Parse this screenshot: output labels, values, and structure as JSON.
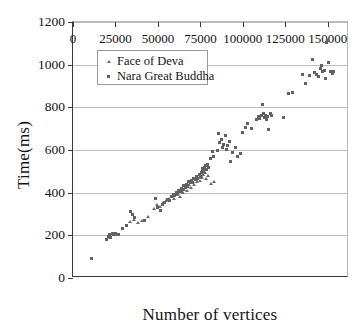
{
  "chart_data": {
    "type": "scatter",
    "title": "",
    "xlabel": "Number of vertices",
    "ylabel": "Time(ms)",
    "xlim": [
      0,
      162500
    ],
    "ylim": [
      0,
      1200
    ],
    "grid": true,
    "grid_axis": "y",
    "legend_position": "upper-left-inside",
    "xticks": [
      0,
      25000,
      50000,
      75000,
      100000,
      125000,
      150000
    ],
    "xtick_labels": [
      "0",
      "25000",
      "50000",
      "75000",
      "100000",
      "125000",
      "150000"
    ],
    "yticks": [
      0,
      200,
      400,
      600,
      800,
      1000,
      1200
    ],
    "ytick_labels": [
      "0",
      "200",
      "400",
      "600",
      "800",
      "1000",
      "1200"
    ],
    "marker_color": "#616161",
    "series": [
      {
        "name": "Face of Deva",
        "marker": "triangle",
        "color": "#6a6a6a",
        "points": [
          [
            21000,
            196
          ],
          [
            22000,
            188
          ],
          [
            23500,
            205
          ],
          [
            26000,
            200
          ],
          [
            33500,
            262
          ],
          [
            36000,
            272
          ],
          [
            38500,
            258
          ],
          [
            40500,
            268
          ],
          [
            44000,
            288
          ],
          [
            47500,
            322
          ],
          [
            49500,
            340
          ],
          [
            51000,
            332
          ],
          [
            53000,
            352
          ],
          [
            55000,
            360
          ],
          [
            56500,
            368
          ],
          [
            58000,
            378
          ],
          [
            59500,
            372
          ],
          [
            61000,
            388
          ],
          [
            62000,
            396
          ],
          [
            63000,
            382
          ],
          [
            64000,
            404
          ],
          [
            64800,
            398
          ],
          [
            65500,
            412
          ],
          [
            66200,
            420
          ],
          [
            67000,
            408
          ],
          [
            67800,
            428
          ],
          [
            68500,
            436
          ],
          [
            69200,
            424
          ],
          [
            70000,
            444
          ],
          [
            70800,
            452
          ],
          [
            71500,
            438
          ],
          [
            72200,
            460
          ],
          [
            73000,
            448
          ],
          [
            73800,
            468
          ],
          [
            74500,
            456
          ],
          [
            75200,
            476
          ],
          [
            76000,
            470
          ],
          [
            76800,
            484
          ],
          [
            77500,
            492
          ],
          [
            78500,
            462
          ],
          [
            79500,
            478
          ],
          [
            81000,
            440
          ],
          [
            83000,
            452
          ]
        ]
      },
      {
        "name": "Nara Great Buddha",
        "marker": "square",
        "color": "#616161",
        "points": [
          [
            11000,
            90
          ],
          [
            20000,
            182
          ],
          [
            20800,
            196
          ],
          [
            21500,
            206
          ],
          [
            22200,
            192
          ],
          [
            23000,
            210
          ],
          [
            24000,
            202
          ],
          [
            25000,
            208
          ],
          [
            26500,
            204
          ],
          [
            29000,
            232
          ],
          [
            31500,
            246
          ],
          [
            34000,
            312
          ],
          [
            35000,
            300
          ],
          [
            36500,
            282
          ],
          [
            42000,
            268
          ],
          [
            48500,
            374
          ],
          [
            50000,
            330
          ],
          [
            51500,
            318
          ],
          [
            52500,
            346
          ],
          [
            54000,
            356
          ],
          [
            55500,
            368
          ],
          [
            57000,
            362
          ],
          [
            58000,
            380
          ],
          [
            59000,
            392
          ],
          [
            60000,
            386
          ],
          [
            60800,
            400
          ],
          [
            61500,
            394
          ],
          [
            62200,
            412
          ],
          [
            63000,
            406
          ],
          [
            63800,
            420
          ],
          [
            64500,
            414
          ],
          [
            65200,
            432
          ],
          [
            66000,
            426
          ],
          [
            66800,
            440
          ],
          [
            67500,
            434
          ],
          [
            68200,
            452
          ],
          [
            69000,
            446
          ],
          [
            69800,
            458
          ],
          [
            70500,
            450
          ],
          [
            71200,
            466
          ],
          [
            72000,
            460
          ],
          [
            72800,
            474
          ],
          [
            73500,
            468
          ],
          [
            74200,
            486
          ],
          [
            75000,
            478
          ],
          [
            75500,
            496
          ],
          [
            76000,
            506
          ],
          [
            76400,
            514
          ],
          [
            76800,
            500
          ],
          [
            77200,
            520
          ],
          [
            77600,
            512
          ],
          [
            78000,
            526
          ],
          [
            78500,
            508
          ],
          [
            79000,
            534
          ],
          [
            80000,
            516
          ],
          [
            81000,
            560
          ],
          [
            82000,
            594
          ],
          [
            83000,
            570
          ],
          [
            85000,
            600
          ],
          [
            85800,
            676
          ],
          [
            86500,
            634
          ],
          [
            87200,
            648
          ],
          [
            88000,
            612
          ],
          [
            88800,
            628
          ],
          [
            89500,
            668
          ],
          [
            90200,
            602
          ],
          [
            91000,
            620
          ],
          [
            92000,
            640
          ],
          [
            93000,
            546
          ],
          [
            94000,
            586
          ],
          [
            95500,
            610
          ],
          [
            97000,
            568
          ],
          [
            98500,
            584
          ],
          [
            100000,
            684
          ],
          [
            101500,
            706
          ],
          [
            103000,
            722
          ],
          [
            105000,
            700
          ],
          [
            108000,
            742
          ],
          [
            109000,
            756
          ],
          [
            110000,
            748
          ],
          [
            110800,
            760
          ],
          [
            111500,
            812
          ],
          [
            112000,
            772
          ],
          [
            112600,
            752
          ],
          [
            113200,
            764
          ],
          [
            113800,
            744
          ],
          [
            114500,
            756
          ],
          [
            115200,
            694
          ],
          [
            116000,
            770
          ],
          [
            117000,
            760
          ],
          [
            124000,
            752
          ],
          [
            127000,
            866
          ],
          [
            129000,
            868
          ],
          [
            135000,
            956
          ],
          [
            137000,
            914
          ],
          [
            139500,
            948
          ],
          [
            141000,
            1024
          ],
          [
            142000,
            962
          ],
          [
            143500,
            956
          ],
          [
            144500,
            946
          ],
          [
            145500,
            984
          ],
          [
            146200,
            998
          ],
          [
            147000,
            966
          ],
          [
            147800,
            972
          ],
          [
            148500,
            934
          ],
          [
            149200,
            1102
          ],
          [
            149800,
            1112
          ],
          [
            150500,
            1012
          ],
          [
            151500,
            970
          ],
          [
            152500,
            958
          ],
          [
            153500,
            966
          ]
        ]
      }
    ]
  },
  "axis": {
    "y_title": "Time(ms)",
    "x_title": "Number of vertices"
  },
  "legend": {
    "entries": [
      {
        "label": "Face of Deva",
        "marker": "triangle"
      },
      {
        "label": "Nara Great Buddha",
        "marker": "square"
      }
    ]
  }
}
